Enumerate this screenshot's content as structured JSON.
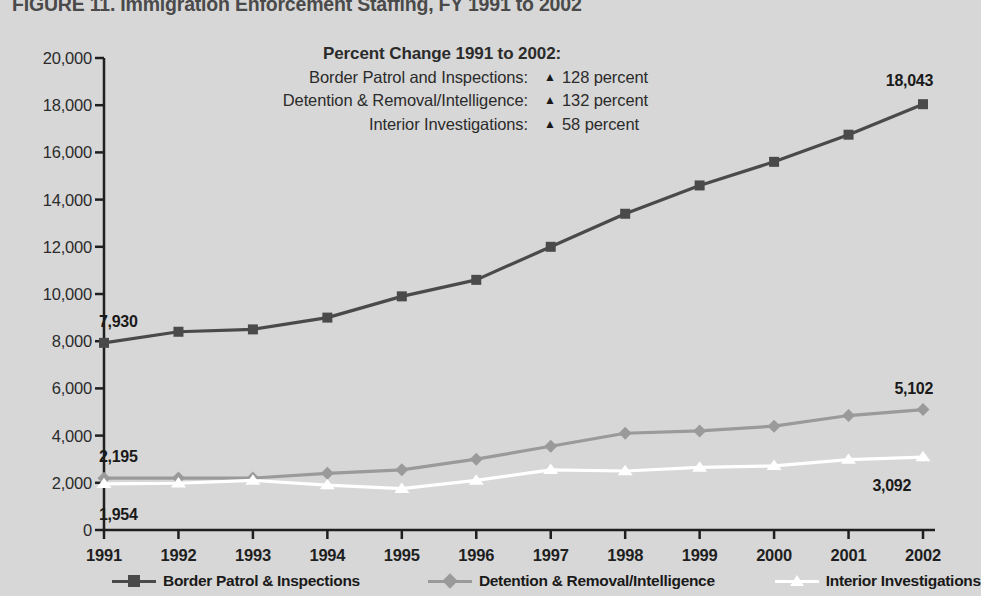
{
  "figure": {
    "title": "FIGURE 11. Immigration Enforcement Staffing, FY 1991 to 2002"
  },
  "annotation": {
    "title": "Percent Change 1991 to 2002:",
    "triangle_glyph": "▲",
    "rows": [
      {
        "label": "Border Patrol and Inspections:",
        "value": "128 percent"
      },
      {
        "label": "Detention & Removal/Intelligence:",
        "value": "132 percent"
      },
      {
        "label": "Interior Investigations:",
        "value": "58 percent"
      }
    ]
  },
  "point_labels": {
    "border_start": "7,930",
    "border_end": "18,043",
    "detention_start": "2,195",
    "detention_end": "5,102",
    "interior_start": "1,954",
    "interior_end": "3,092"
  },
  "legend": {
    "items": [
      {
        "label": "Border Patrol & Inspections",
        "marker": "square",
        "color": "#4a4a4a"
      },
      {
        "label": "Detention & Removal/Intelligence",
        "marker": "diamond",
        "color": "#9a9a9a"
      },
      {
        "label": "Interior Investigations",
        "marker": "triangle",
        "color": "#ffffff"
      }
    ]
  },
  "colors": {
    "background": "#d7d7d7",
    "axis": "#1f1f1f",
    "border_patrol": "#4a4a4a",
    "detention": "#9a9a9a",
    "interior": "#ffffff",
    "text": "#2b2b2b"
  },
  "chart_data": {
    "type": "line",
    "title": "FIGURE 11. Immigration Enforcement Staffing, FY 1991 to 2002",
    "xlabel": "",
    "ylabel": "",
    "categories": [
      "1991",
      "1992",
      "1993",
      "1994",
      "1995",
      "1996",
      "1997",
      "1998",
      "1999",
      "2000",
      "2001",
      "2002"
    ],
    "x": [
      1991,
      1992,
      1993,
      1994,
      1995,
      1996,
      1997,
      1998,
      1999,
      2000,
      2001,
      2002
    ],
    "ylim": [
      0,
      20000
    ],
    "ytick_labels": [
      "0",
      "2,000",
      "4,000",
      "6,000",
      "8,000",
      "10,000",
      "12,000",
      "14,000",
      "16,000",
      "18,000",
      "20,000"
    ],
    "yticks": [
      0,
      2000,
      4000,
      6000,
      8000,
      10000,
      12000,
      14000,
      16000,
      18000,
      20000
    ],
    "grid": false,
    "legend_position": "bottom",
    "series": [
      {
        "name": "Border Patrol & Inspections",
        "marker": "square",
        "color": "#4a4a4a",
        "values": [
          7930,
          8400,
          8500,
          9000,
          9900,
          10600,
          12000,
          13400,
          14600,
          15600,
          16750,
          18043
        ],
        "labeled_points": {
          "1991": "7,930",
          "2002": "18,043"
        }
      },
      {
        "name": "Detention & Removal/Intelligence",
        "marker": "diamond",
        "color": "#9a9a9a",
        "values": [
          2195,
          2200,
          2200,
          2400,
          2550,
          3000,
          3550,
          4100,
          4200,
          4400,
          4850,
          5102
        ],
        "labeled_points": {
          "1991": "2,195",
          "2002": "5,102"
        }
      },
      {
        "name": "Interior Investigations",
        "marker": "triangle",
        "color": "#ffffff",
        "values": [
          1954,
          1980,
          2100,
          1900,
          1750,
          2100,
          2550,
          2500,
          2650,
          2720,
          2980,
          3092
        ],
        "labeled_points": {
          "1991": "1,954",
          "2002": "3,092"
        }
      }
    ],
    "annotations": [
      {
        "text": "Percent Change 1991 to 2002:",
        "type": "heading"
      },
      {
        "text": "Border Patrol and Inspections: ▲ 128 percent",
        "series": "Border Patrol & Inspections",
        "change_percent": 128,
        "direction": "up"
      },
      {
        "text": "Detention & Removal/Intelligence: ▲ 132 percent",
        "series": "Detention & Removal/Intelligence",
        "change_percent": 132,
        "direction": "up"
      },
      {
        "text": "Interior Investigations: ▲ 58 percent",
        "series": "Interior Investigations",
        "change_percent": 58,
        "direction": "up"
      }
    ]
  }
}
